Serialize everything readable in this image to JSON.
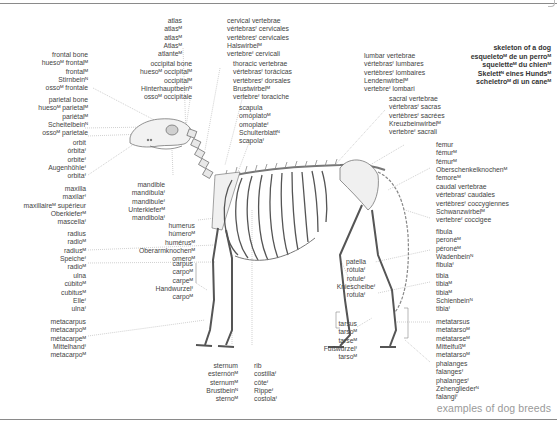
{
  "title": {
    "lines": [
      "skeleton of a dog",
      "esqueletoᴹ de un perroᴹ",
      "squeletteᴹ du chienᴹ",
      "Skelettᴺ eines Hundsᴹ",
      "scheletroᴹ di un caneᴹ"
    ]
  },
  "footer": {
    "link_label": "examples of dog breeds"
  },
  "labels": {
    "atlas": [
      "atlas",
      "atlasᴹ",
      "atlasᴹ",
      "Atlasᴹ",
      "atlanteᴹ"
    ],
    "cervical": [
      "cervical vertebrae",
      "vértebrasᶠ cervicales",
      "vertèbresᶠ cervicales",
      "Halswirbelᴹ",
      "vertebreᶠ cervicali"
    ],
    "frontal": [
      "frontal bone",
      "huesoᴹ frontalᴹ",
      "frontalᴹ",
      "Stirnbeinᴺ",
      "ossoᴹ frontale"
    ],
    "occipital": [
      "occipital bone",
      "huesoᴹ occipitalᴹ",
      "occipitalᴹ",
      "Hinterhauptbeinᴺ",
      "ossoᴹ occipitale"
    ],
    "thoracic": [
      "thoracic vertebrae",
      "vértebrasᶠ torácicas",
      "vertèbresᶠ dorsales",
      "Brustwirbelᴹ",
      "vertebreᶠ toraciche"
    ],
    "lumbar": [
      "lumbar vertebrae",
      "vértebrasᶠ lumbares",
      "vertèbresᶠ lombaires",
      "Lendenwirbelᴹ",
      "vertebreᶠ lombari"
    ],
    "sacral": [
      "sacral vertebrae",
      "vértebrasᶠ sacras",
      "vertèbresᶠ sacrées",
      "Kreuzbeinwirbelᴹ",
      "vertebreᶠ sacrali"
    ],
    "parietal": [
      "parietal bone",
      "huesoᴹ parietalᴹ",
      "pariétalᴹ",
      "Scheitelbeinᴺ",
      "ossoᴹ parietale"
    ],
    "scapula": [
      "scapula",
      "omóplatoᴹ",
      "omoplateᶠ",
      "Schulterblattᴺ",
      "scapolaᶠ"
    ],
    "orbit": [
      "orbit",
      "órbitaᶠ",
      "orbiteᶠ",
      "Augenhöhleᶠ",
      "orbitaᶠ"
    ],
    "femur": [
      "femur",
      "fémurᴹ",
      "fémurᴹ",
      "Oberschenkelknochenᴹ",
      "femoreᴹ"
    ],
    "maxilla": [
      "maxilla",
      "maxilarᶠ",
      "maxillaireᴹ supérieur",
      "Oberkieferᴹ",
      "mascellaᶠ"
    ],
    "mandible": [
      "mandible",
      "mandíbulaᶠ",
      "mandibuleᶠ",
      "Unterkieferᴹ",
      "mandibolaᶠ"
    ],
    "caudal": [
      "caudal vertebrae",
      "vértebrasᶠ caudales",
      "vertèbresᶠ coccygiennes",
      "Schwanzwirbelᴹ",
      "vertebreᶠ coccigee"
    ],
    "radius": [
      "radius",
      "radioᴹ",
      "radiusᴹ",
      "Speicheᶠ",
      "radioᴹ"
    ],
    "humerus": [
      "humerus",
      "húmeroᴹ",
      "humérusᴹ",
      "Oberarmknochenᴹ",
      "omeroᴹ"
    ],
    "fibula": [
      "fibula",
      "peronéᴹ",
      "péronéᴹ",
      "Wadenbeinᴺ",
      "fibulaᶠ"
    ],
    "patella": [
      "patella",
      "rótulaᶠ",
      "rotuleᶠ",
      "Kniescheibeᶠ",
      "rotulaᶠ"
    ],
    "ulna": [
      "ulna",
      "cúbitoᴹ",
      "cubitusᴹ",
      "Elleᶠ",
      "ulnaᶠ"
    ],
    "carpus": [
      "carpus",
      "carpoᴹ",
      "carpeᴹ",
      "Handwurzelᶠ",
      "carpoᴹ"
    ],
    "tibia": [
      "tibia",
      "tibiaᴹ",
      "tibiaᴹ",
      "Schienbeinᴺ",
      "tibiaᶠ"
    ],
    "metacarpus": [
      "metacarpus",
      "metacarpoᴹ",
      "métacarpeᴹ",
      "Mittelhandᶠ",
      "metacarpoᴹ"
    ],
    "tarsus": [
      "tarsus",
      "tarsoᴹ",
      "tarseᴹ",
      "Fußwurzelᶠ",
      "tarsoᴹ"
    ],
    "metatarsus": [
      "metatarsus",
      "metatarsoᴹ",
      "métatarseᴹ",
      "Mittelfußᴹ",
      "metatarsoᴹ"
    ],
    "sternum": [
      "sternum",
      "esternónᴹ",
      "sternumᴹ",
      "Brustbeinᴺ",
      "sternoᴹ"
    ],
    "rib": [
      "rib",
      "costillaᶠ",
      "côteᶠ",
      "Rippeᶠ",
      "costolaᶠ"
    ],
    "phalanges": [
      "phalanges",
      "falangesᶠ",
      "phalangesᶠ",
      "Zehengliederᴺ",
      "falangiᶠ"
    ]
  },
  "colors": {
    "text": "#444444",
    "leader": "#9a9a9a",
    "bone_fill": "#f3f3f3",
    "bone_stroke": "#6a6a6a",
    "footer": "#9a9a9a",
    "rule": "#8a8a8a"
  }
}
